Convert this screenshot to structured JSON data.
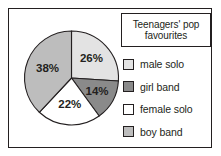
{
  "chart_data": {
    "type": "pie",
    "title": "Teenagers' pop favourites",
    "title_lines": [
      "Teenagers' pop",
      "favourites"
    ],
    "categories": [
      "male solo",
      "girl band",
      "female solo",
      "boy band"
    ],
    "values": [
      26,
      14,
      22,
      38
    ],
    "value_labels": [
      "26%",
      "14%",
      "22%",
      "38%"
    ],
    "colors": [
      "#e3e3e3",
      "#8a8a8a",
      "#ffffff",
      "#bdbdbd"
    ],
    "start_angle_deg": 0,
    "direction": "clockwise",
    "units": "percent",
    "xlabel": "",
    "ylabel": "",
    "grid": false,
    "legend_position": "right",
    "slices": [
      {
        "label": "male solo",
        "value": 26,
        "value_label": "26%",
        "color": "#e3e3e3"
      },
      {
        "label": "girl band",
        "value": 14,
        "value_label": "14%",
        "color": "#8a8a8a"
      },
      {
        "label": "female solo",
        "value": 22,
        "value_label": "22%",
        "color": "#ffffff"
      },
      {
        "label": "boy band",
        "value": 38,
        "value_label": "38%",
        "color": "#bdbdbd"
      }
    ]
  },
  "figure": {
    "border_color": "#231f20",
    "background": "#ffffff"
  },
  "legend": {
    "items": [
      {
        "label": "male solo",
        "color": "#e3e3e3"
      },
      {
        "label": "girl band",
        "color": "#8a8a8a"
      },
      {
        "label": "female solo",
        "color": "#ffffff"
      },
      {
        "label": "boy band",
        "color": "#bdbdbd"
      }
    ]
  }
}
